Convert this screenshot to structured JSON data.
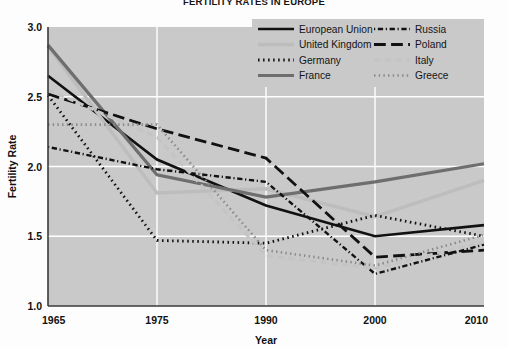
{
  "chart_data": {
    "type": "line",
    "title": "FERTILITY RATES IN EUROPE",
    "xlabel": "Year",
    "ylabel": "Fertility Rate",
    "categories": [
      "1965",
      "1975",
      "1990",
      "2000",
      "2010"
    ],
    "x": [
      1965,
      1975,
      1990,
      2000,
      2010
    ],
    "ylim": [
      1.0,
      3.0
    ],
    "yticks": [
      "1.0",
      "1.5",
      "2.0",
      "2.5",
      "3.0"
    ],
    "ytick_values": [
      1.0,
      1.5,
      2.0,
      2.5,
      3.0
    ],
    "grid": "both-white-gridlines",
    "legend_position": "top-right",
    "plot_background": "#c9c9c9",
    "series": [
      {
        "name": "European Union",
        "values": [
          2.65,
          2.05,
          1.72,
          1.5,
          1.58
        ],
        "color": "#111111",
        "style": "solid",
        "width": 2.6
      },
      {
        "name": "United Kingdom",
        "values": [
          2.86,
          1.81,
          1.84,
          1.64,
          1.9
        ],
        "color": "#bdbdbd",
        "style": "solid",
        "width": 3.4
      },
      {
        "name": "Germany",
        "values": [
          2.51,
          1.47,
          1.45,
          1.65,
          1.5
        ],
        "color": "#111111",
        "style": "dotted",
        "width": 2.8
      },
      {
        "name": "France",
        "values": [
          2.87,
          1.94,
          1.78,
          1.89,
          2.02
        ],
        "color": "#6e6e6e",
        "style": "solid",
        "width": 3.2
      },
      {
        "name": "Russia",
        "values": [
          2.14,
          1.98,
          1.89,
          1.23,
          1.44
        ],
        "color": "#111111",
        "style": "dashdot",
        "width": 2.4
      },
      {
        "name": "Poland",
        "values": [
          2.52,
          2.27,
          2.06,
          1.35,
          1.4
        ],
        "color": "#111111",
        "style": "longdash",
        "width": 2.8
      },
      {
        "name": "Italy",
        "values": [
          2.55,
          2.21,
          1.36,
          1.27,
          1.46
        ],
        "color": "#c4c4c4",
        "style": "dashed",
        "width": 3.0
      },
      {
        "name": "Greece",
        "values": [
          2.3,
          2.3,
          1.4,
          1.29,
          1.51
        ],
        "color": "#8a8a8a",
        "style": "dotted",
        "width": 2.6
      }
    ],
    "legend_columns": [
      [
        "European Union",
        "United Kingdom",
        "Germany",
        "France"
      ],
      [
        "Russia",
        "Poland",
        "Italy",
        "Greece"
      ]
    ]
  }
}
